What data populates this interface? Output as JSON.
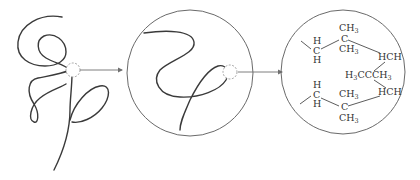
{
  "diagram": {
    "stages": [
      {
        "id": "coil",
        "label": "polymer-chain-coil"
      },
      {
        "id": "magnified",
        "label": "magnified-chain-segment"
      },
      {
        "id": "molecular",
        "label": "molecular-structure"
      }
    ],
    "colors": {
      "line": "#3a3a3a",
      "ring": "#6a6a6a",
      "arrow": "#707070",
      "dashed_circle": "#9a9a9a"
    },
    "chemistry": {
      "top_ch": {
        "top": "H",
        "middle": "C",
        "bottom": "H"
      },
      "top_quaternary": {
        "above": "CH",
        "above_sub": "3",
        "center": "C",
        "below": "CH",
        "below_sub": "3"
      },
      "hch_upper": "HCH",
      "center_group": {
        "left": "H",
        "left_sub": "3",
        "mid": "CCCH",
        "right_sub": "3"
      },
      "hch_lower": "HCH",
      "bottom_ch": {
        "top": "H",
        "middle": "C",
        "bottom": "H"
      },
      "bottom_quaternary": {
        "above": "CH",
        "above_sub": "3",
        "center": "C",
        "below": "CH",
        "below_sub": "3"
      }
    }
  }
}
